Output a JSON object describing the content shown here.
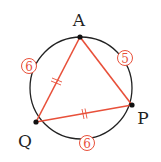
{
  "diagram": {
    "colors": {
      "circle": "#222222",
      "triangle": "#e8503a",
      "arc_label": "#e8503a",
      "vertex": "#111111",
      "text": "#222222"
    },
    "circle": {
      "cx": 81,
      "cy": 88,
      "r": 51
    },
    "vertices": [
      {
        "name": "A",
        "x": 80,
        "y": 37,
        "label_x": 79,
        "label_y": 26
      },
      {
        "name": "P",
        "x": 132,
        "y": 105,
        "label_x": 143,
        "label_y": 124
      },
      {
        "name": "Q",
        "x": 36,
        "y": 122,
        "label_x": 25,
        "label_y": 147
      }
    ],
    "triangle_sides": [
      {
        "from": "A",
        "to": "Q",
        "tick": "double"
      },
      {
        "from": "Q",
        "to": "P",
        "tick": "double"
      },
      {
        "from": "A",
        "to": "P",
        "tick": "none"
      }
    ],
    "arc_labels": [
      {
        "value": "6",
        "arc": "AQ",
        "x": 29,
        "y": 66
      },
      {
        "value": "5",
        "arc": "AP",
        "x": 125,
        "y": 58
      },
      {
        "value": "6",
        "arc": "QP",
        "x": 87,
        "y": 143
      }
    ]
  }
}
